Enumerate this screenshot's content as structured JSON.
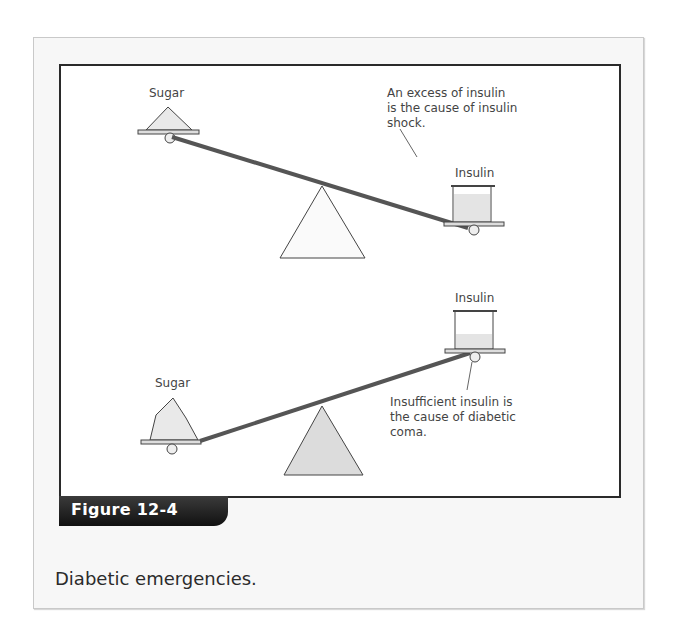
{
  "figure": {
    "label": "Figure 12-4",
    "caption": "Diabetic emergencies."
  },
  "top_diagram": {
    "left_label": "Sugar",
    "right_label": "Insulin",
    "annotation_lines": [
      "An excess of insulin",
      "is the cause of insulin",
      "shock."
    ]
  },
  "bottom_diagram": {
    "left_label": "Sugar",
    "right_label": "Insulin",
    "annotation_lines": [
      "Insufficient insulin is",
      "the cause of diabetic",
      "coma."
    ]
  },
  "colors": {
    "frame": "#2a2a2a",
    "tab_bg": "#1a1a1a",
    "beam": "#555555",
    "fulcrum_top": "#fafafa",
    "fulcrum_bottom": "#dcdcdc"
  }
}
